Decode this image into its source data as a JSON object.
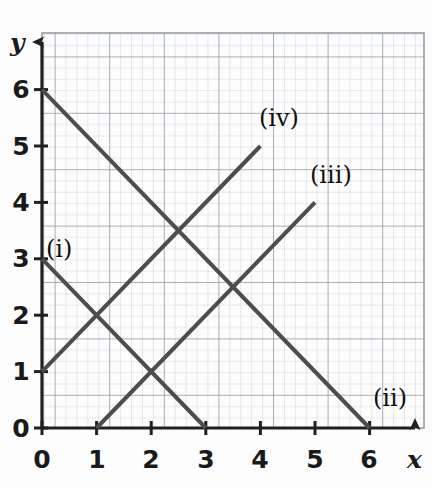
{
  "figure": {
    "kind": "coordinate-grid-graph",
    "background_color": "#fdfdfd",
    "grid_minor_color": "#cfd3da",
    "grid_major_color": "#9aa0aa",
    "axis_color": "#231f20",
    "line_color": "#4d4d4d"
  },
  "axes": {
    "x_name": "x",
    "y_name": "y",
    "x_tick_labels": [
      "0",
      "1",
      "2",
      "3",
      "4",
      "5",
      "6"
    ],
    "y_tick_labels": [
      "0",
      "1",
      "2",
      "3",
      "4",
      "5",
      "6"
    ]
  },
  "labels": {
    "i": "(i)",
    "ii": "(ii)",
    "iii": "(iii)",
    "iv": "(iv)"
  },
  "chart_data": {
    "type": "line",
    "title": "",
    "xlabel": "x",
    "ylabel": "y",
    "xlim": [
      0,
      7
    ],
    "ylim": [
      0,
      7
    ],
    "xticks": [
      0,
      1,
      2,
      3,
      4,
      5,
      6
    ],
    "yticks": [
      0,
      1,
      2,
      3,
      4,
      5,
      6
    ],
    "grid": true,
    "grid_major_step": 1,
    "grid_minor_step": 0.2,
    "legend": "inline-labels",
    "series": [
      {
        "name": "(i)",
        "equation": "y = 3 - x",
        "slope": -1,
        "intercept": 3,
        "points": [
          [
            0,
            3
          ],
          [
            3,
            0
          ]
        ],
        "label_position": [
          0.25,
          3.4
        ]
      },
      {
        "name": "(ii)",
        "equation": "y = 6 - x",
        "slope": -1,
        "intercept": 6,
        "points": [
          [
            0,
            6
          ],
          [
            6,
            0
          ]
        ],
        "label_position": [
          6.25,
          0.5
        ]
      },
      {
        "name": "(iii)",
        "equation": "y = x - 1",
        "slope": 1,
        "intercept": -1,
        "points": [
          [
            1,
            0
          ],
          [
            5,
            4
          ]
        ],
        "label_position": [
          5.1,
          4.55
        ]
      },
      {
        "name": "(iv)",
        "equation": "y = x + 1",
        "slope": 1,
        "intercept": 1,
        "points": [
          [
            0,
            1
          ],
          [
            4,
            5
          ]
        ],
        "label_position": [
          4.15,
          5.55
        ]
      }
    ],
    "intersections": [
      {
        "lines": [
          "(i)",
          "(iv)"
        ],
        "point": [
          1,
          2
        ]
      },
      {
        "lines": [
          "(i)",
          "(iii)"
        ],
        "point": [
          2,
          1
        ]
      },
      {
        "lines": [
          "(ii)",
          "(iv)"
        ],
        "point": [
          2.5,
          3.5
        ]
      },
      {
        "lines": [
          "(ii)",
          "(iii)"
        ],
        "point": [
          3.5,
          2.5
        ]
      }
    ]
  }
}
